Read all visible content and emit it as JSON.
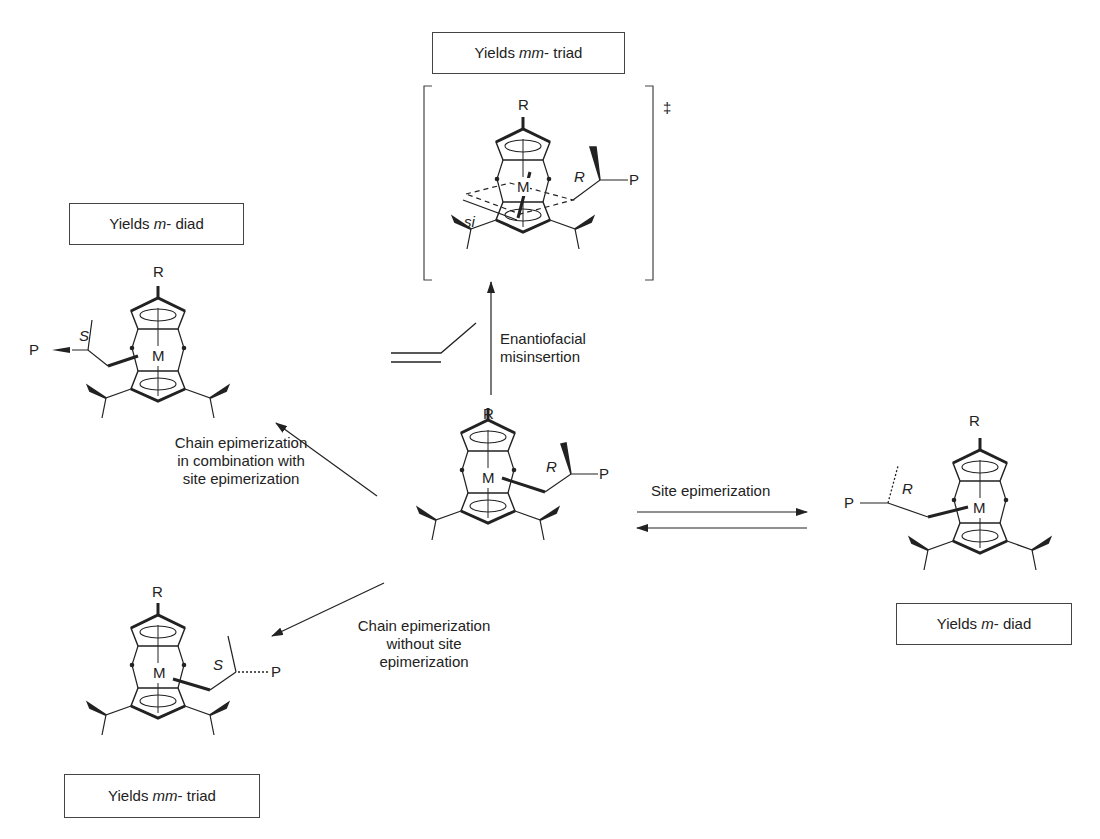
{
  "boxes": {
    "top": {
      "prefix": "Yields ",
      "italic": "mm",
      "suffix": "- triad"
    },
    "left": {
      "prefix": "Yields ",
      "italic": "m",
      "suffix": "- diad"
    },
    "right": {
      "prefix": "Yields ",
      "italic": "m",
      "suffix": "- diad"
    },
    "bottom": {
      "prefix": "Yields ",
      "italic": "mm",
      "suffix": "- triad"
    }
  },
  "arrows": {
    "up": {
      "line1": "Enantiofacial",
      "line2": "misinsertion"
    },
    "upper_left": {
      "line1": "Chain epimerization",
      "line2": "in combination with",
      "line3": "site epimerization"
    },
    "right": {
      "label": "Site epimerization"
    },
    "lower_left": {
      "line1": "Chain epimerization",
      "line2": "without site",
      "line3": "epimerization"
    }
  },
  "atoms": {
    "metal": "M",
    "substituent": "R",
    "polymer": "P",
    "config_R": "R",
    "config_S": "S",
    "face": "si",
    "transition_state": "‡"
  }
}
